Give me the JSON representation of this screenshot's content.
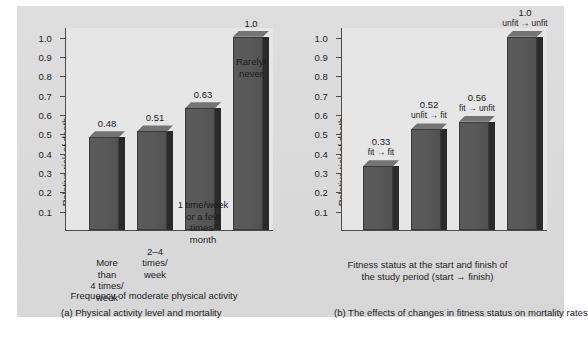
{
  "figure": {
    "background_color": "#dcdcdc",
    "plot_background_color": "#e6e6e6",
    "bar_color": "#585858",
    "bar_top_color": "#747474",
    "bar_side_color": "#2a2a2a",
    "axis_color": "#4c4c4c",
    "text_color": "#1d1d1d"
  },
  "panel_a": {
    "caption": "(a) Physical activity level and mortality",
    "ylabel": "Relative risk of death",
    "xlabel": "Frequency of moderate physical activity",
    "ticklabels": [
      "1.0",
      "0.9",
      "0.8",
      "0.7",
      "0.6",
      "0.5",
      "0.4",
      "0.3",
      "0.2",
      "0.1"
    ],
    "bars": [
      {
        "value_label": "0.48",
        "category": "More\nthan\n4 times/\nweek"
      },
      {
        "value_label": "0.51",
        "category": "2–4\ntimes/\nweek"
      },
      {
        "value_label": "0.63",
        "category": "1 time/week\nor a few\ntimes/\nmonth"
      },
      {
        "value_label": "1.0",
        "category": "Rarely/\nnever"
      }
    ]
  },
  "panel_b": {
    "caption": "(b) The effects of changes in fitness status on mortality rates",
    "ylabel": "Relative risk of death",
    "xlabel": "Fitness status at the start and finish of\nthe study period (start → finish)",
    "ticklabels": [
      "1.0",
      "0.9",
      "0.8",
      "0.7",
      "0.6",
      "0.5",
      "0.4",
      "0.3",
      "0.2",
      "0.1"
    ],
    "bars": [
      {
        "value_label": "0.33",
        "sub_label": "fit → fit"
      },
      {
        "value_label": "0.52",
        "sub_label": "unfit → fit"
      },
      {
        "value_label": "0.56",
        "sub_label": "fit → unfit"
      },
      {
        "value_label": "1.0",
        "sub_label": "unfit → unfit"
      }
    ]
  },
  "chart_data": [
    {
      "type": "bar",
      "title": "(a) Physical activity level and mortality",
      "xlabel": "Frequency of moderate physical activity",
      "ylabel": "Relative risk of death",
      "categories": [
        "More than 4 times/week",
        "2-4 times/week",
        "1 time/week or a few times/month",
        "Rarely/never"
      ],
      "values": [
        0.48,
        0.51,
        0.63,
        1.0
      ],
      "data_labels": [
        "0.48",
        "0.51",
        "0.63",
        "1.0"
      ],
      "ylim": [
        0,
        1.05
      ],
      "yticks": [
        0.1,
        0.2,
        0.3,
        0.4,
        0.5,
        0.6,
        0.7,
        0.8,
        0.9,
        1.0
      ],
      "ytick_labels": [
        "0.1",
        "0.2",
        "0.3",
        "0.4",
        "0.5",
        "0.6",
        "0.7",
        "0.8",
        "0.9",
        "1.0"
      ],
      "grid": false,
      "legend": "none",
      "series_count": 1,
      "style": "3d-bar-grayscale"
    },
    {
      "type": "bar",
      "title": "(b) The effects of changes in fitness status on mortality rates",
      "xlabel": "Fitness status at the start and finish of the study period (start → finish)",
      "ylabel": "Relative risk of death",
      "categories": [
        "fit → fit",
        "unfit → fit",
        "fit → unfit",
        "unfit → unfit"
      ],
      "values": [
        0.33,
        0.52,
        0.56,
        1.0
      ],
      "data_labels": [
        "0.33",
        "0.52",
        "0.56",
        "1.0"
      ],
      "ylim": [
        0,
        1.05
      ],
      "yticks": [
        0.1,
        0.2,
        0.3,
        0.4,
        0.5,
        0.6,
        0.7,
        0.8,
        0.9,
        1.0
      ],
      "ytick_labels": [
        "0.1",
        "0.2",
        "0.3",
        "0.4",
        "0.5",
        "0.6",
        "0.7",
        "0.8",
        "0.9",
        "1.0"
      ],
      "grid": false,
      "legend": "none",
      "series_count": 1,
      "style": "3d-bar-grayscale"
    }
  ]
}
